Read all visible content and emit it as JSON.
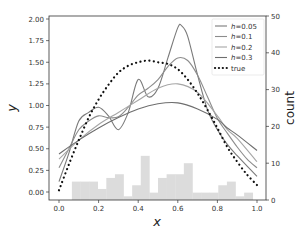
{
  "chart_data": {
    "type": "line",
    "title": "",
    "xlabel": "x",
    "ylabel": "y",
    "ylabel_right": "count",
    "xlim": [
      -0.03,
      1.03
    ],
    "ylim": [
      -0.07,
      2.0
    ],
    "ylim_right": [
      0,
      50
    ],
    "x_ticks": [
      "0.0",
      "0.2",
      "0.4",
      "0.6",
      "0.8",
      "1.0"
    ],
    "y_ticks": [
      "0.00",
      "0.25",
      "0.50",
      "0.75",
      "1.00",
      "1.25",
      "1.50",
      "1.75",
      "2.00"
    ],
    "y_ticks_right": [
      "0",
      "10",
      "20",
      "30",
      "40",
      "50"
    ],
    "grid": false,
    "legend_position": "upper right",
    "legend": [
      "h=0.05",
      "h=0.1",
      "h=0.2",
      "h=0.3",
      "true"
    ],
    "series": [
      {
        "name": "h=0.05",
        "color": "#7a7a7a",
        "style": "solid",
        "x": [
          0.0,
          0.05,
          0.1,
          0.15,
          0.2,
          0.25,
          0.3,
          0.35,
          0.4,
          0.45,
          0.5,
          0.55,
          0.6,
          0.62,
          0.65,
          0.7,
          0.75,
          0.8,
          0.85,
          0.9,
          0.95,
          1.0
        ],
        "y": [
          0.12,
          0.45,
          0.82,
          0.92,
          0.98,
          0.88,
          0.72,
          0.92,
          1.3,
          1.1,
          1.2,
          1.55,
          1.9,
          1.92,
          1.8,
          1.35,
          0.95,
          0.72,
          0.55,
          0.42,
          0.3,
          0.18
        ]
      },
      {
        "name": "h=0.1",
        "color": "#8c8c8c",
        "style": "solid",
        "x": [
          0.0,
          0.05,
          0.1,
          0.15,
          0.2,
          0.25,
          0.3,
          0.35,
          0.4,
          0.45,
          0.5,
          0.55,
          0.6,
          0.65,
          0.7,
          0.75,
          0.8,
          0.85,
          0.9,
          0.95,
          1.0
        ],
        "y": [
          0.28,
          0.5,
          0.72,
          0.82,
          0.88,
          0.86,
          0.87,
          0.98,
          1.12,
          1.2,
          1.3,
          1.45,
          1.55,
          1.52,
          1.35,
          1.1,
          0.85,
          0.68,
          0.52,
          0.38,
          0.28
        ]
      },
      {
        "name": "h=0.2",
        "color": "#a6a6a6",
        "style": "solid",
        "x": [
          0.0,
          0.1,
          0.2,
          0.3,
          0.4,
          0.5,
          0.6,
          0.7,
          0.8,
          0.85,
          0.9,
          1.0
        ],
        "y": [
          0.38,
          0.6,
          0.78,
          0.92,
          1.06,
          1.2,
          1.25,
          1.15,
          0.88,
          0.72,
          0.62,
          0.35
        ]
      },
      {
        "name": "h=0.3",
        "color": "#6e6e6e",
        "style": "solid",
        "x": [
          0.0,
          0.1,
          0.2,
          0.3,
          0.4,
          0.5,
          0.6,
          0.7,
          0.8,
          0.85,
          0.9,
          1.0
        ],
        "y": [
          0.44,
          0.6,
          0.74,
          0.86,
          0.96,
          1.02,
          1.03,
          0.96,
          0.84,
          0.74,
          0.66,
          0.48
        ]
      },
      {
        "name": "true",
        "color": "#111111",
        "style": "dotted",
        "x": [
          0.0,
          0.05,
          0.1,
          0.15,
          0.2,
          0.25,
          0.3,
          0.35,
          0.4,
          0.45,
          0.5,
          0.55,
          0.6,
          0.65,
          0.7,
          0.75,
          0.8,
          0.85,
          0.9,
          0.95,
          1.0
        ],
        "y": [
          0.02,
          0.32,
          0.6,
          0.86,
          1.07,
          1.24,
          1.38,
          1.46,
          1.5,
          1.52,
          1.5,
          1.48,
          1.42,
          1.3,
          1.14,
          0.95,
          0.74,
          0.52,
          0.35,
          0.2,
          0.08
        ]
      }
    ],
    "histogram": {
      "axis": "right",
      "color": "#dcdcdc",
      "bin_width": 0.0435,
      "bin_left_edges": [
        0.065,
        0.1085,
        0.152,
        0.1955,
        0.239,
        0.2825,
        0.326,
        0.3695,
        0.413,
        0.4565,
        0.5,
        0.5435,
        0.587,
        0.6305,
        0.674,
        0.7175,
        0.761,
        0.8045,
        0.848,
        0.8915,
        0.935
      ],
      "counts": [
        5,
        5,
        5,
        3,
        6,
        7,
        1,
        4,
        12,
        2,
        6,
        7,
        7,
        10,
        2,
        2,
        2,
        4,
        5,
        1,
        2
      ]
    }
  },
  "axes_box": {
    "left": 49,
    "right": 266,
    "top": 16,
    "bottom": 200
  },
  "x_map": {
    "x0_px": 59,
    "x1_px": 257
  },
  "y_map": {
    "y0_px": 192,
    "y2_px": 19
  },
  "y_right_map": {
    "c0_px": 200,
    "c50_px": 16
  }
}
